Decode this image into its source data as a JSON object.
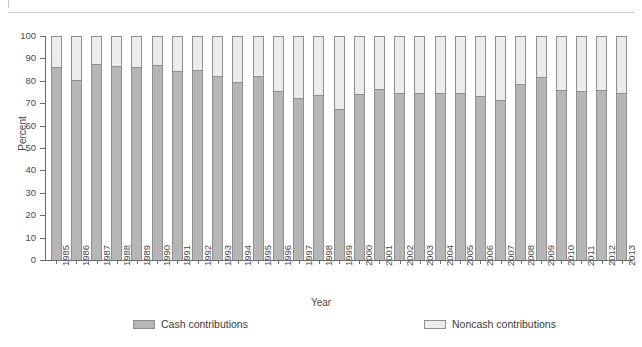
{
  "chart_data": {
    "type": "bar",
    "stacked": true,
    "stack_total": 100,
    "title": "",
    "xlabel": "Year",
    "ylabel": "Percent",
    "ylim": [
      0,
      100
    ],
    "ytick_step": 10,
    "yticks": [
      0,
      10,
      20,
      30,
      40,
      50,
      60,
      70,
      80,
      90,
      100
    ],
    "ytick_labels": [
      "0",
      "10",
      "20",
      "30",
      "40",
      "50",
      "60",
      "70",
      "80",
      "90",
      "100"
    ],
    "grid": false,
    "legend_position": "bottom",
    "categories": [
      "1985",
      "1986",
      "1987",
      "1988",
      "1989",
      "1990",
      "1991",
      "1992",
      "1993",
      "1994",
      "1995",
      "1996",
      "1997",
      "1998",
      "1999",
      "2000",
      "2001",
      "2002",
      "2003",
      "2004",
      "2005",
      "2006",
      "2007",
      "2008",
      "2009",
      "2010",
      "2011",
      "2012",
      "2013"
    ],
    "series": [
      {
        "name": "Cash contributions",
        "color": "#b6b6b6",
        "values": [
          86.0,
          80.5,
          87.5,
          86.5,
          86.0,
          87.0,
          84.5,
          85.0,
          82.0,
          79.5,
          82.0,
          75.5,
          72.5,
          73.5,
          67.5,
          74.0,
          76.5,
          74.5,
          74.5,
          74.5,
          74.5,
          73.0,
          71.5,
          78.5,
          81.5,
          76.0,
          75.5,
          76.0,
          74.5
        ]
      },
      {
        "name": "Noncash contributions",
        "color": "#ececed",
        "values": [
          14.0,
          19.5,
          12.5,
          13.5,
          14.0,
          13.0,
          15.5,
          15.0,
          18.0,
          20.5,
          18.0,
          24.5,
          27.5,
          26.5,
          32.5,
          26.0,
          23.5,
          25.5,
          25.5,
          25.5,
          25.5,
          27.0,
          28.5,
          21.5,
          18.5,
          24.0,
          24.5,
          24.0,
          25.5
        ]
      }
    ]
  },
  "legend": {
    "cash_label": "Cash contributions",
    "noncash_label": "Noncash contributions"
  },
  "colors": {
    "cash": "#b6b6b6",
    "noncash": "#ececed",
    "outline": "#8f8f8f",
    "axis": "#6b6b6b",
    "text": "#4a4a4a"
  }
}
